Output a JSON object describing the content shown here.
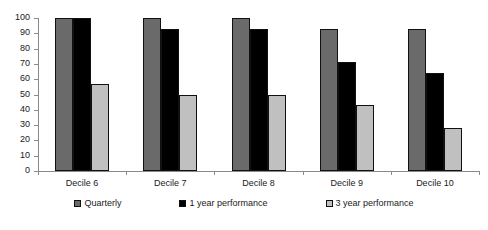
{
  "chart_data": {
    "type": "bar",
    "title": "",
    "subtitle": "",
    "xlabel": "",
    "ylabel": "",
    "ylim": [
      0,
      100
    ],
    "yticks": [
      0,
      10,
      20,
      30,
      40,
      50,
      60,
      70,
      80,
      90,
      100
    ],
    "grid": false,
    "legend_position": "bottom",
    "categories": [
      "Decile 6",
      "Decile 7",
      "Decile 8",
      "Decile 9",
      "Decile 10"
    ],
    "series": [
      {
        "name": "Quarterly",
        "color": "#6a6a6a",
        "values": [
          100,
          100,
          100,
          93,
          93
        ]
      },
      {
        "name": "1 year performance",
        "color": "#000000",
        "values": [
          100,
          93,
          93,
          71,
          64
        ]
      },
      {
        "name": "3 year performance",
        "color": "#c0c0c0",
        "values": [
          57,
          50,
          50,
          43,
          28
        ]
      }
    ]
  },
  "axis": {
    "y_tick_labels": [
      "0",
      "10",
      "20",
      "30",
      "40",
      "50",
      "60",
      "70",
      "80",
      "90",
      "100"
    ],
    "x_tick_labels": [
      "Decile 6",
      "Decile 7",
      "Decile 8",
      "Decile 9",
      "Decile 10"
    ]
  },
  "legend": {
    "items": [
      {
        "label": "Quarterly",
        "color": "#6a6a6a"
      },
      {
        "label": "1 year performance",
        "color": "#000000"
      },
      {
        "label": "3 year performance",
        "color": "#c0c0c0"
      }
    ]
  }
}
